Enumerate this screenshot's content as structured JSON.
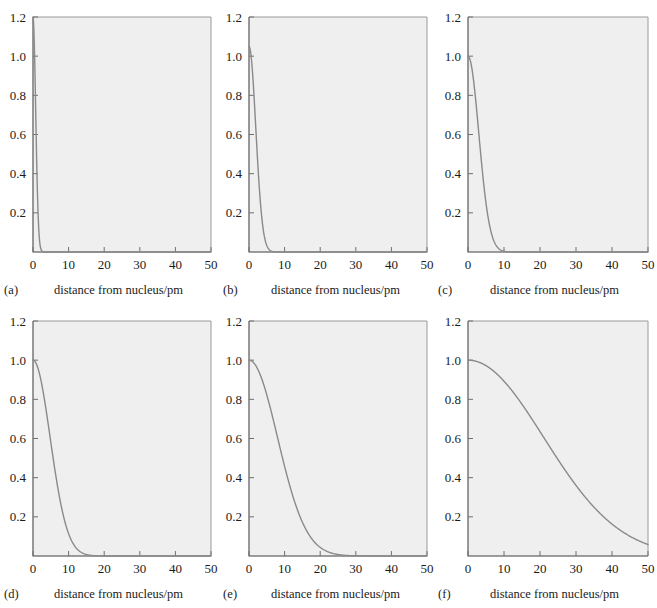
{
  "figure": {
    "panel_count": 6,
    "axis_label": "distance from nucleus/pm",
    "xticks": [
      "0",
      "10",
      "20",
      "30",
      "40",
      "50"
    ],
    "yticks": [
      "0.2",
      "0.4",
      "0.6",
      "0.8",
      "1.0",
      "1.2"
    ],
    "curve_color": "#8a8a8a",
    "frame_color": "#9a9a9a",
    "plot_bg": "#efefef",
    "text_color": "#1a1a1a"
  },
  "panels": [
    {
      "id": "a",
      "caption": "(a)",
      "xlabel": "distance from nucleus/pm"
    },
    {
      "id": "b",
      "caption": "(b)",
      "xlabel": "distance from nucleus/pm"
    },
    {
      "id": "c",
      "caption": "(c)",
      "xlabel": "distance from nucleus/pm"
    },
    {
      "id": "d",
      "caption": "(d)",
      "xlabel": "distance from nucleus/pm"
    },
    {
      "id": "e",
      "caption": "(e)",
      "xlabel": "distance from nucleus/pm"
    },
    {
      "id": "f",
      "caption": "(f)",
      "xlabel": "distance from nucleus/pm"
    }
  ],
  "chart_data": {
    "type": "line",
    "title": "",
    "xlabel": "distance from nucleus/pm",
    "ylabel": "",
    "xlim": [
      0,
      50
    ],
    "ylim": [
      0,
      1.2
    ],
    "xticks": [
      0,
      10,
      20,
      30,
      40,
      50
    ],
    "yticks": [
      0.2,
      0.4,
      0.6,
      0.8,
      1.0,
      1.2
    ],
    "grid": false,
    "legend": "none",
    "panels": [
      {
        "label": "(a)",
        "decay_width_pm": 0.75,
        "peak_value": 1.2,
        "zero_crossing_pm": 2,
        "x": [
          0,
          0.25,
          0.5,
          0.75,
          1,
          1.25,
          1.5,
          1.75,
          2,
          2.5,
          3,
          4,
          6,
          10,
          20,
          30,
          40,
          50
        ],
        "y": [
          1.2,
          1.09,
          0.8,
          0.49,
          0.24,
          0.1,
          0.03,
          0.01,
          0.004,
          0.001,
          0.0,
          0.0,
          0.0,
          0.0,
          0.0,
          0.0,
          0.0,
          0.0
        ]
      },
      {
        "label": "(b)",
        "decay_width_pm": 1.9,
        "peak_value": 1.05,
        "zero_crossing_pm": 5,
        "x": [
          0,
          0.5,
          1,
          1.5,
          2,
          2.5,
          3,
          3.5,
          4,
          4.5,
          5,
          6,
          8,
          10,
          20,
          30,
          40,
          50
        ],
        "y": [
          1.06,
          1.03,
          0.93,
          0.78,
          0.6,
          0.42,
          0.27,
          0.16,
          0.085,
          0.042,
          0.019,
          0.004,
          0.0,
          0.0,
          0.0,
          0.0,
          0.0,
          0.0
        ]
      },
      {
        "label": "(c)",
        "decay_width_pm": 3.0,
        "peak_value": 1.0,
        "zero_crossing_pm": 8,
        "x": [
          0,
          0.5,
          1,
          2,
          3,
          4,
          5,
          6,
          7,
          8,
          9,
          10,
          12,
          15,
          20,
          30,
          40,
          50
        ],
        "y": [
          1.0,
          0.99,
          0.96,
          0.85,
          0.68,
          0.49,
          0.31,
          0.17,
          0.08,
          0.035,
          0.013,
          0.005,
          0.0,
          0.0,
          0.0,
          0.0,
          0.0,
          0.0
        ]
      },
      {
        "label": "(d)",
        "decay_width_pm": 4.8,
        "peak_value": 1.0,
        "zero_crossing_pm": 12,
        "x": [
          0,
          1,
          2,
          3,
          4,
          5,
          6,
          7,
          8,
          9,
          10,
          11,
          12,
          14,
          16,
          20,
          30,
          50
        ],
        "y": [
          1.0,
          0.98,
          0.93,
          0.84,
          0.72,
          0.59,
          0.45,
          0.32,
          0.21,
          0.13,
          0.073,
          0.038,
          0.018,
          0.004,
          0.0,
          0.0,
          0.0,
          0.0
        ]
      },
      {
        "label": "(e)",
        "decay_width_pm": 8.0,
        "peak_value": 1.0,
        "zero_crossing_pm": 20,
        "x": [
          0,
          1,
          2,
          4,
          6,
          8,
          10,
          12,
          14,
          16,
          18,
          20,
          22,
          25,
          30,
          35,
          40,
          50
        ],
        "y": [
          1.0,
          0.99,
          0.97,
          0.89,
          0.78,
          0.64,
          0.5,
          0.36,
          0.24,
          0.15,
          0.088,
          0.046,
          0.022,
          0.007,
          0.0,
          0.0,
          0.0,
          0.0
        ]
      },
      {
        "label": "(f)",
        "decay_width_pm": 21.0,
        "peak_value": 1.0,
        "zero_crossing_pm": 55,
        "x": [
          0,
          2,
          5,
          8,
          10,
          14,
          18,
          20,
          24,
          28,
          32,
          36,
          40,
          44,
          46,
          48,
          50
        ],
        "y": [
          1.0,
          0.99,
          0.96,
          0.9,
          0.85,
          0.72,
          0.58,
          0.5,
          0.37,
          0.26,
          0.17,
          0.11,
          0.065,
          0.036,
          0.027,
          0.02,
          0.015
        ]
      }
    ]
  }
}
